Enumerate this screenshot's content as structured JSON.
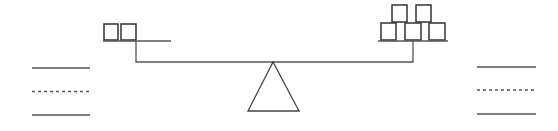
{
  "diagram": {
    "type": "balance-scale",
    "stroke_color": "#333333",
    "line_color": "#555555",
    "left_pan": {
      "box_count": 2,
      "rows": [
        2
      ]
    },
    "right_pan": {
      "box_count": 5,
      "rows": [
        3,
        2
      ]
    },
    "left_answer_lines": [
      {
        "style": "solid"
      },
      {
        "style": "dashed"
      },
      {
        "style": "solid"
      }
    ],
    "right_answer_lines": [
      {
        "style": "solid"
      },
      {
        "style": "dashed"
      },
      {
        "style": "solid"
      }
    ]
  }
}
